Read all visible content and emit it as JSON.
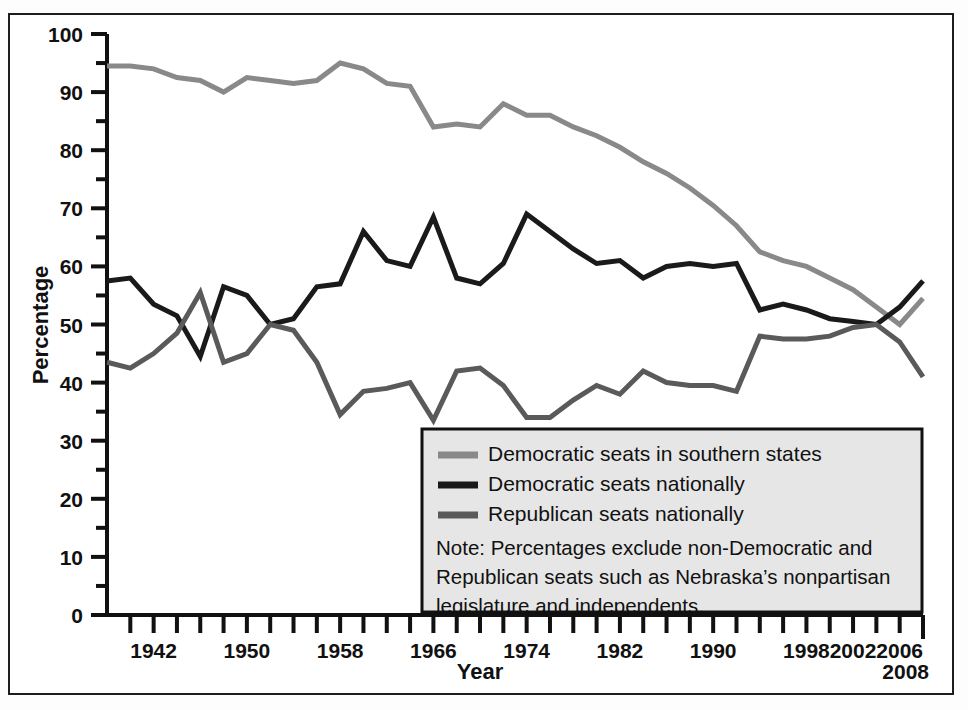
{
  "figure": {
    "background_color": "#ffffff",
    "frame_color": "#1d1d1d"
  },
  "axes": {
    "y_title": "Percentage",
    "x_title": "Year",
    "y_ticks": [
      "0",
      "10",
      "20",
      "30",
      "40",
      "50",
      "60",
      "70",
      "80",
      "90",
      "100"
    ],
    "x_ticks": [
      "1942",
      "1950",
      "1958",
      "1966",
      "1974",
      "1982",
      "1990",
      "1998",
      "2002",
      "2006",
      "2008"
    ]
  },
  "legend": {
    "entries": [
      {
        "label": "Democratic seats in southern states",
        "color": "#898989"
      },
      {
        "label": "Democratic seats nationally",
        "color": "#1a1a1a"
      },
      {
        "label": "Republican seats nationally",
        "color": "#5a5a5a"
      }
    ],
    "note_lines": [
      "Note: Percentages exclude non-Democratic and",
      "Republican seats such as Nebraska’s nonpartisan",
      "legislature and independents."
    ],
    "background_color": "#e6e6e6",
    "border_color": "#111111"
  },
  "chart_data": {
    "type": "line",
    "title": "",
    "xlabel": "Year",
    "ylabel": "Percentage",
    "xlim": [
      1938,
      2008
    ],
    "ylim": [
      0,
      100
    ],
    "grid": false,
    "legend_position": "inside-bottom-right",
    "x": [
      1938,
      1940,
      1942,
      1944,
      1946,
      1948,
      1950,
      1952,
      1954,
      1956,
      1958,
      1960,
      1962,
      1964,
      1966,
      1968,
      1970,
      1972,
      1974,
      1976,
      1978,
      1980,
      1982,
      1984,
      1986,
      1988,
      1990,
      1992,
      1994,
      1996,
      1998,
      2000,
      2002,
      2004,
      2006,
      2008
    ],
    "series": [
      {
        "name": "Democratic seats in southern states",
        "color": "#898989",
        "values": [
          94.5,
          94.5,
          94.0,
          92.5,
          92.0,
          90.0,
          92.5,
          92.0,
          91.5,
          92.0,
          95.0,
          94.0,
          91.5,
          91.0,
          84.0,
          84.5,
          84.0,
          88.0,
          86.0,
          86.0,
          84.0,
          82.5,
          80.5,
          78.0,
          76.0,
          73.5,
          70.5,
          67.0,
          62.5,
          61.0,
          60.0,
          58.0,
          56.0,
          53.0,
          50.0,
          54.5
        ]
      },
      {
        "name": "Democratic seats nationally",
        "color": "#1a1a1a",
        "values": [
          57.5,
          58.0,
          53.5,
          51.5,
          44.5,
          56.5,
          55.0,
          50.0,
          51.0,
          56.5,
          57.0,
          66.0,
          61.0,
          60.0,
          68.5,
          58.0,
          57.0,
          60.5,
          69.0,
          66.0,
          63.0,
          60.5,
          61.0,
          58.0,
          60.0,
          60.5,
          60.0,
          60.5,
          52.5,
          53.5,
          52.5,
          51.0,
          50.5,
          50.0,
          53.0,
          57.5
        ]
      },
      {
        "name": "Republican seats nationally",
        "color": "#5a5a5a",
        "values": [
          43.5,
          42.5,
          45.0,
          48.5,
          55.5,
          43.5,
          45.0,
          50.0,
          49.0,
          43.5,
          34.5,
          38.5,
          39.0,
          40.0,
          33.5,
          42.0,
          42.5,
          39.5,
          34.0,
          34.0,
          37.0,
          39.5,
          38.0,
          42.0,
          40.0,
          39.5,
          39.5,
          38.5,
          48.0,
          47.5,
          47.5,
          48.0,
          49.5,
          50.0,
          47.0,
          41.0
        ]
      }
    ]
  }
}
